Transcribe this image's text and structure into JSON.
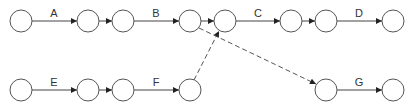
{
  "diagram": {
    "type": "activity-on-arrow network",
    "node_radius": 11,
    "nodes": [
      {
        "id": "n1",
        "x": 21,
        "y": 21
      },
      {
        "id": "n2",
        "x": 88,
        "y": 21
      },
      {
        "id": "n3",
        "x": 123,
        "y": 21
      },
      {
        "id": "n4",
        "x": 190,
        "y": 21
      },
      {
        "id": "n5",
        "x": 225,
        "y": 21
      },
      {
        "id": "n6",
        "x": 291,
        "y": 21
      },
      {
        "id": "n7",
        "x": 326,
        "y": 21
      },
      {
        "id": "n8",
        "x": 393,
        "y": 21
      },
      {
        "id": "n9",
        "x": 21,
        "y": 90
      },
      {
        "id": "n10",
        "x": 88,
        "y": 90
      },
      {
        "id": "n11",
        "x": 123,
        "y": 90
      },
      {
        "id": "n12",
        "x": 190,
        "y": 90
      },
      {
        "id": "n13",
        "x": 326,
        "y": 90
      },
      {
        "id": "n14",
        "x": 393,
        "y": 90
      }
    ],
    "edges": [
      {
        "from": "n1",
        "to": "n2",
        "label": "A",
        "style": "solid"
      },
      {
        "from": "n2",
        "to": "n3",
        "label": "",
        "style": "solid"
      },
      {
        "from": "n3",
        "to": "n4",
        "label": "B",
        "style": "solid"
      },
      {
        "from": "n4",
        "to": "n5",
        "label": "",
        "style": "solid"
      },
      {
        "from": "n5",
        "to": "n6",
        "label": "C",
        "style": "solid"
      },
      {
        "from": "n6",
        "to": "n7",
        "label": "",
        "style": "solid"
      },
      {
        "from": "n7",
        "to": "n8",
        "label": "D",
        "style": "solid"
      },
      {
        "from": "n9",
        "to": "n10",
        "label": "E",
        "style": "solid"
      },
      {
        "from": "n10",
        "to": "n11",
        "label": "",
        "style": "solid"
      },
      {
        "from": "n11",
        "to": "n12",
        "label": "F",
        "style": "solid"
      },
      {
        "from": "n12",
        "to": "n5",
        "label": "",
        "style": "dashed"
      },
      {
        "from": "n4",
        "to": "n13",
        "label": "",
        "style": "dashed"
      },
      {
        "from": "n13",
        "to": "n14",
        "label": "G",
        "style": "solid"
      }
    ],
    "labels": {
      "A": "A",
      "B": "B",
      "C": "C",
      "D": "D",
      "E": "E",
      "F": "F",
      "G": "G"
    }
  }
}
